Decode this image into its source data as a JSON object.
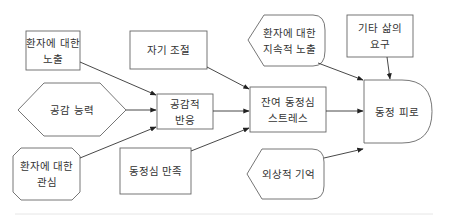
{
  "diagram": {
    "nodes": [
      {
        "id": "exposure",
        "label": "환자에 대한\n노출",
        "shape": "rectangle"
      },
      {
        "id": "self_regulation",
        "label": "자기 조절",
        "shape": "rectangle"
      },
      {
        "id": "empathic_ability",
        "label": "공감 능력",
        "shape": "hexagon"
      },
      {
        "id": "empathic_response",
        "label": "공감적\n반응",
        "shape": "rectangle"
      },
      {
        "id": "empathic_concern",
        "label": "환자에 대한\n관심",
        "shape": "octagon"
      },
      {
        "id": "compassion_satisfaction",
        "label": "동정심 만족",
        "shape": "rectangle"
      },
      {
        "id": "residual_stress",
        "label": "잔여 동정심\n스트레스",
        "shape": "rectangle"
      },
      {
        "id": "prolonged_exposure",
        "label": "환자에 대한\n지속적 노출",
        "shape": "display"
      },
      {
        "id": "other_demands",
        "label": "기타 삶의\n요구",
        "shape": "rectangle"
      },
      {
        "id": "compassion_fatigue",
        "label": "동정 피로",
        "shape": "delay"
      },
      {
        "id": "traumatic_memories",
        "label": "외상적 기억",
        "shape": "display"
      }
    ],
    "edges": [
      {
        "from": "exposure",
        "to": "empathic_response"
      },
      {
        "from": "empathic_ability",
        "to": "empathic_response"
      },
      {
        "from": "empathic_concern",
        "to": "empathic_response"
      },
      {
        "from": "self_regulation",
        "to": "residual_stress"
      },
      {
        "from": "empathic_response",
        "to": "residual_stress"
      },
      {
        "from": "compassion_satisfaction",
        "to": "residual_stress"
      },
      {
        "from": "prolonged_exposure",
        "to": "compassion_fatigue"
      },
      {
        "from": "other_demands",
        "to": "compassion_fatigue"
      },
      {
        "from": "residual_stress",
        "to": "compassion_fatigue"
      },
      {
        "from": "traumatic_memories",
        "to": "compassion_fatigue"
      }
    ],
    "colors": {
      "stroke": "#555555",
      "text": "#333333",
      "background": "#ffffff",
      "rule": "#e6e6e6"
    }
  }
}
